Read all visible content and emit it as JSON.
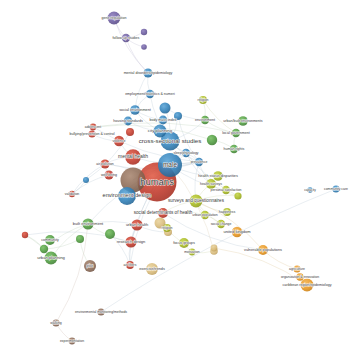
{
  "figure": {
    "type": "bibliometric-network-map",
    "tool_style": "VOSviewer network visualization",
    "background_color": "#ffffff",
    "caption": "",
    "width": 363,
    "height": 355
  },
  "clusters": [
    {
      "id": "red",
      "label_hint": "health / humans core",
      "color": "#c0392b"
    },
    {
      "id": "blue",
      "label_hint": "urban design & planning",
      "color": "#2e7fb8"
    },
    {
      "id": "green",
      "label_hint": "built environment & community",
      "color": "#4e9a3e"
    },
    {
      "id": "olive",
      "label_hint": "surveys & wellbeing",
      "color": "#a6b81e"
    },
    {
      "id": "orange",
      "label_hint": "regional / agriculture",
      "color": "#e8961e"
    },
    {
      "id": "purple",
      "label_hint": "gene regulation / follow-up",
      "color": "#6a5a9e"
    },
    {
      "id": "brown",
      "label_hint": "environmental monitoring",
      "color": "#8c6a55"
    },
    {
      "id": "tan",
      "label_hint": "focus groups / research design",
      "color": "#d9bb7a"
    }
  ],
  "chart_data": {
    "type": "scatter",
    "title": "",
    "xlabel": "",
    "ylabel": "",
    "grid": false,
    "legend": "none",
    "nodes": [
      {
        "label": "gene regulation",
        "x": 114,
        "y": 18,
        "size": 6.5,
        "cluster": "purple",
        "font": 3.6
      },
      {
        "label": "follow-up studies",
        "x": 126,
        "y": 38,
        "size": 4.2,
        "cluster": "purple",
        "font": 3.6
      },
      {
        "label": "",
        "x": 144,
        "y": 32,
        "size": 3.2,
        "cluster": "purple",
        "font": 0
      },
      {
        "label": "",
        "x": 144,
        "y": 47,
        "size": 2.8,
        "cluster": "purple",
        "font": 0
      },
      {
        "label": "mental disorders/epidemiology",
        "x": 148,
        "y": 73,
        "size": 4.6,
        "cluster": "blue",
        "font": 3.6
      },
      {
        "label": "employment/statistics & numeri",
        "x": 150,
        "y": 94,
        "size": 4.2,
        "cluster": "blue",
        "font": 3.6
      },
      {
        "label": "social environment",
        "x": 135,
        "y": 110,
        "size": 4.8,
        "cluster": "blue",
        "font": 3.8
      },
      {
        "label": "housing standards",
        "x": 128,
        "y": 121,
        "size": 4.4,
        "cluster": "blue",
        "font": 3.6
      },
      {
        "label": "body mass index",
        "x": 163,
        "y": 120,
        "size": 4.4,
        "cluster": "blue",
        "font": 3.6
      },
      {
        "label": "city planning",
        "x": 160,
        "y": 131,
        "size": 6.5,
        "cluster": "blue",
        "font": 4.4
      },
      {
        "label": "cross-sectional studies",
        "x": 170,
        "y": 141,
        "size": 9.5,
        "cluster": "blue",
        "font": 6.2
      },
      {
        "label": "",
        "x": 165,
        "y": 108,
        "size": 5.5,
        "cluster": "blue",
        "font": 0
      },
      {
        "label": "",
        "x": 178,
        "y": 116,
        "size": 4.0,
        "cluster": "blue",
        "font": 0
      },
      {
        "label": "environment",
        "x": 205,
        "y": 120,
        "size": 4.2,
        "cluster": "green",
        "font": 3.6
      },
      {
        "label": "religion",
        "x": 203,
        "y": 100,
        "size": 4.0,
        "cluster": "olive",
        "font": 3.4
      },
      {
        "label": "urban/built environments",
        "x": 243,
        "y": 121,
        "size": 4.8,
        "cluster": "green",
        "font": 3.6
      },
      {
        "label": "local government",
        "x": 236,
        "y": 133,
        "size": 4.2,
        "cluster": "green",
        "font": 3.6
      },
      {
        "label": "human rights",
        "x": 234,
        "y": 149,
        "size": 4.2,
        "cluster": "green",
        "font": 3.6
      },
      {
        "label": "",
        "x": 212,
        "y": 140,
        "size": 5.2,
        "cluster": "green",
        "font": 0
      },
      {
        "label": "adolescent",
        "x": 93,
        "y": 127,
        "size": 3.4,
        "cluster": "red",
        "font": 3.4
      },
      {
        "label": "bullying/prevention & control",
        "x": 92,
        "y": 134,
        "size": 3.6,
        "cluster": "red",
        "font": 3.6
      },
      {
        "label": "violence",
        "x": 119,
        "y": 141,
        "size": 5.2,
        "cluster": "red",
        "font": 3.6
      },
      {
        "label": "mental health",
        "x": 133,
        "y": 157,
        "size": 7.8,
        "cluster": "red",
        "font": 5.0
      },
      {
        "label": "air pollution",
        "x": 105,
        "y": 164,
        "size": 4.6,
        "cluster": "red",
        "font": 3.4
      },
      {
        "label": "well-being",
        "x": 109,
        "y": 175,
        "size": 4.6,
        "cluster": "red",
        "font": 3.6
      },
      {
        "label": "validation",
        "x": 72,
        "y": 194,
        "size": 3.2,
        "cluster": "red",
        "font": 3.4
      },
      {
        "label": "",
        "x": 86,
        "y": 180,
        "size": 3.0,
        "cluster": "blue",
        "font": 0
      },
      {
        "label": "",
        "x": 130,
        "y": 132,
        "size": 4.0,
        "cluster": "red",
        "font": 0
      },
      {
        "label": "humans",
        "x": 157,
        "y": 182,
        "size": 19.5,
        "cluster": "red",
        "font": 9.5
      },
      {
        "label": "male",
        "x": 170,
        "y": 165,
        "size": 12.0,
        "cluster": "blue",
        "font": 6.5
      },
      {
        "label": "prevalence",
        "x": 199,
        "y": 162,
        "size": 4.2,
        "cluster": "blue",
        "font": 3.4
      },
      {
        "label": "sleep/physiology",
        "x": 186,
        "y": 153,
        "size": 4.2,
        "cluster": "blue",
        "font": 3.4
      },
      {
        "label": "",
        "x": 133,
        "y": 180,
        "size": 12.5,
        "cluster": "brown",
        "font": 0
      },
      {
        "label": "environment design",
        "x": 127,
        "y": 196,
        "size": 9.0,
        "cluster": "blue",
        "font": 5.6
      },
      {
        "label": "health status disparities",
        "x": 218,
        "y": 176,
        "size": 4.8,
        "cluster": "olive",
        "font": 3.8
      },
      {
        "label": "personal satisfaction",
        "x": 226,
        "y": 190,
        "size": 4.2,
        "cluster": "olive",
        "font": 3.4
      },
      {
        "label": "health surveys",
        "x": 211,
        "y": 184,
        "size": 5.0,
        "cluster": "olive",
        "font": 3.4
      },
      {
        "label": "",
        "x": 238,
        "y": 196,
        "size": 3.6,
        "cluster": "olive",
        "font": 0
      },
      {
        "label": "surveys and questionnaires",
        "x": 196,
        "y": 201,
        "size": 6.5,
        "cluster": "olive",
        "font": 4.6
      },
      {
        "label": "happiness",
        "x": 227,
        "y": 212,
        "size": 4.0,
        "cluster": "olive",
        "font": 3.6
      },
      {
        "label": "social change",
        "x": 221,
        "y": 224,
        "size": 4.2,
        "cluster": "olive",
        "font": 3.4
      },
      {
        "label": "urban population",
        "x": 205,
        "y": 215,
        "size": 4.2,
        "cluster": "olive",
        "font": 3.4
      },
      {
        "label": "social determinants of health",
        "x": 163,
        "y": 213,
        "size": 5.0,
        "cluster": "red",
        "font": 4.6
      },
      {
        "label": "urban health",
        "x": 137,
        "y": 225,
        "size": 5.6,
        "cluster": "red",
        "font": 4.0
      },
      {
        "label": "built environment",
        "x": 88,
        "y": 224,
        "size": 5.6,
        "cluster": "green",
        "font": 4.0
      },
      {
        "label": "research design",
        "x": 131,
        "y": 242,
        "size": 5.6,
        "cluster": "red",
        "font": 4.0
      },
      {
        "label": "air filters",
        "x": 130,
        "y": 265,
        "size": 4.0,
        "cluster": "red",
        "font": 3.4
      },
      {
        "label": "",
        "x": 110,
        "y": 234,
        "size": 5.0,
        "cluster": "green",
        "font": 0
      },
      {
        "label": "",
        "x": 160,
        "y": 223,
        "size": 5.5,
        "cluster": "tan",
        "font": 0
      },
      {
        "label": "",
        "x": 168,
        "y": 232,
        "size": 4.0,
        "cluster": "tan",
        "font": 0
      },
      {
        "label": "religion",
        "x": 167,
        "y": 228,
        "size": 4.0,
        "cluster": "olive",
        "font": 3.4
      },
      {
        "label": "focus groups",
        "x": 184,
        "y": 243,
        "size": 5.0,
        "cluster": "olive",
        "font": 3.8
      },
      {
        "label": "motivation",
        "x": 192,
        "y": 252,
        "size": 3.4,
        "cluster": "olive",
        "font": 3.4
      },
      {
        "label": "",
        "x": 214,
        "y": 251,
        "size": 3.8,
        "cluster": "tan",
        "font": 0
      },
      {
        "label": "exercise/trends",
        "x": 152,
        "y": 269,
        "size": 6.0,
        "cluster": "tan",
        "font": 3.8
      },
      {
        "label": "community",
        "x": 50,
        "y": 240,
        "size": 5.0,
        "cluster": "green",
        "font": 3.6
      },
      {
        "label": "urban planning",
        "x": 51,
        "y": 258,
        "size": 6.5,
        "cluster": "green",
        "font": 4.2
      },
      {
        "label": "",
        "x": 44,
        "y": 249,
        "size": 4.2,
        "cluster": "green",
        "font": 0
      },
      {
        "label": "",
        "x": 80,
        "y": 239,
        "size": 4.0,
        "cluster": "green",
        "font": 0
      },
      {
        "label": "pilot",
        "x": 90,
        "y": 266,
        "size": 6.0,
        "cluster": "brown",
        "font": 3.6
      },
      {
        "label": "",
        "x": 25,
        "y": 235,
        "size": 3.2,
        "cluster": "red",
        "font": 0
      },
      {
        "label": "united kingdom",
        "x": 237,
        "y": 232,
        "size": 5.2,
        "cluster": "orange",
        "font": 4.0
      },
      {
        "label": "vulnerable populations",
        "x": 263,
        "y": 250,
        "size": 5.0,
        "cluster": "orange",
        "font": 3.8
      },
      {
        "label": "agriculture",
        "x": 297,
        "y": 269,
        "size": 3.6,
        "cluster": "orange",
        "font": 3.4
      },
      {
        "label": "organization & innovation",
        "x": 300,
        "y": 277,
        "size": 3.8,
        "cluster": "orange",
        "font": 3.4
      },
      {
        "label": "caribbean region/epidemiology",
        "x": 307,
        "y": 285,
        "size": 6.5,
        "cluster": "orange",
        "font": 3.6
      },
      {
        "label": "",
        "x": 214,
        "y": 248,
        "size": 3.4,
        "cluster": "tan",
        "font": 0
      },
      {
        "label": "capacity",
        "x": 310,
        "y": 190,
        "size": 2.8,
        "cluster": "blue",
        "font": 3.2
      },
      {
        "label": "community care",
        "x": 336,
        "y": 189,
        "size": 3.6,
        "cluster": "blue",
        "font": 3.4
      },
      {
        "label": "environmental monitoring/methods",
        "x": 101,
        "y": 312,
        "size": 3.6,
        "cluster": "brown",
        "font": 3.4
      },
      {
        "label": "walking",
        "x": 56,
        "y": 323,
        "size": 3.6,
        "cluster": "brown",
        "font": 3.4
      },
      {
        "label": "experimentation",
        "x": 72,
        "y": 341,
        "size": 3.4,
        "cluster": "brown",
        "font": 3.4
      }
    ],
    "edges": [
      [
        0,
        1
      ],
      [
        0,
        4
      ],
      [
        1,
        2
      ],
      [
        1,
        3
      ],
      [
        1,
        4
      ],
      [
        4,
        5
      ],
      [
        4,
        6
      ],
      [
        5,
        6
      ],
      [
        5,
        10
      ],
      [
        6,
        7
      ],
      [
        6,
        8
      ],
      [
        6,
        9
      ],
      [
        7,
        9
      ],
      [
        8,
        9
      ],
      [
        9,
        10
      ],
      [
        10,
        11
      ],
      [
        10,
        12
      ],
      [
        10,
        13
      ],
      [
        10,
        30
      ],
      [
        10,
        31
      ],
      [
        11,
        13
      ],
      [
        12,
        30
      ],
      [
        13,
        14
      ],
      [
        13,
        16
      ],
      [
        14,
        16
      ],
      [
        16,
        17
      ],
      [
        17,
        18
      ],
      [
        18,
        19
      ],
      [
        16,
        19
      ],
      [
        19,
        30
      ],
      [
        20,
        21
      ],
      [
        21,
        22
      ],
      [
        22,
        23
      ],
      [
        23,
        24
      ],
      [
        23,
        25
      ],
      [
        24,
        25
      ],
      [
        25,
        26
      ],
      [
        26,
        27
      ],
      [
        23,
        30
      ],
      [
        22,
        30
      ],
      [
        28,
        23
      ],
      [
        29,
        30
      ],
      [
        29,
        31
      ],
      [
        29,
        34
      ],
      [
        29,
        35
      ],
      [
        29,
        43
      ],
      [
        29,
        44
      ],
      [
        29,
        45
      ],
      [
        29,
        46
      ],
      [
        30,
        31
      ],
      [
        30,
        32
      ],
      [
        30,
        33
      ],
      [
        30,
        36
      ],
      [
        30,
        38
      ],
      [
        31,
        32
      ],
      [
        31,
        33
      ],
      [
        31,
        36
      ],
      [
        31,
        37
      ],
      [
        36,
        37
      ],
      [
        36,
        38
      ],
      [
        37,
        38
      ],
      [
        38,
        39
      ],
      [
        38,
        40
      ],
      [
        38,
        41
      ],
      [
        38,
        42
      ],
      [
        40,
        41
      ],
      [
        41,
        42
      ],
      [
        42,
        62
      ],
      [
        43,
        44
      ],
      [
        43,
        45
      ],
      [
        43,
        46
      ],
      [
        43,
        49
      ],
      [
        44,
        45
      ],
      [
        45,
        46
      ],
      [
        46,
        47
      ],
      [
        44,
        56
      ],
      [
        44,
        57
      ],
      [
        45,
        60
      ],
      [
        49,
        50
      ],
      [
        50,
        51
      ],
      [
        51,
        52
      ],
      [
        52,
        53
      ],
      [
        53,
        29
      ],
      [
        56,
        57
      ],
      [
        57,
        58
      ],
      [
        58,
        59
      ],
      [
        56,
        60
      ],
      [
        57,
        60
      ],
      [
        62,
        63
      ],
      [
        63,
        64
      ],
      [
        64,
        65
      ],
      [
        65,
        66
      ],
      [
        62,
        38
      ],
      [
        68,
        69
      ],
      [
        70,
        71
      ],
      [
        71,
        72
      ],
      [
        70,
        44
      ]
    ]
  }
}
